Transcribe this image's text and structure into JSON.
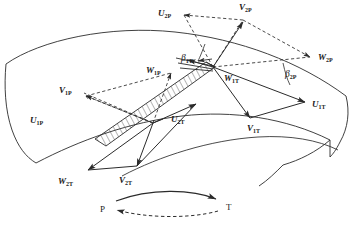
{
  "figure": {
    "type": "velocity-triangle-diagram",
    "stroke_color": "#2b2b2b",
    "label_color": "#1a1a1a",
    "background": "#ffffff"
  },
  "vectors": [
    {
      "id": "U2P",
      "symbol": "U",
      "subscript": "2P",
      "style": "dashed",
      "x": 158,
      "y": 9
    },
    {
      "id": "V2P",
      "symbol": "V",
      "subscript": "2P",
      "style": "solid",
      "x": 239,
      "y": 3
    },
    {
      "id": "W2P",
      "symbol": "W",
      "subscript": "2P",
      "style": "dashed",
      "x": 318,
      "y": 53
    },
    {
      "id": "W1P",
      "symbol": "W",
      "subscript": "1P",
      "style": "dashed",
      "x": 146,
      "y": 66
    },
    {
      "id": "V1P",
      "symbol": "V",
      "subscript": "1P",
      "style": "dashed",
      "x": 59,
      "y": 86
    },
    {
      "id": "U1P",
      "symbol": "U",
      "subscript": "1P",
      "style": "dashed",
      "x": 30,
      "y": 116
    },
    {
      "id": "W1T",
      "symbol": "W",
      "subscript": "1T",
      "style": "solid",
      "x": 224,
      "y": 74
    },
    {
      "id": "U1T",
      "symbol": "U",
      "subscript": "1T",
      "style": "solid",
      "x": 312,
      "y": 100
    },
    {
      "id": "V1T",
      "symbol": "V",
      "subscript": "1T",
      "style": "solid",
      "x": 247,
      "y": 124
    },
    {
      "id": "U2T",
      "symbol": "U",
      "subscript": "2T",
      "style": "solid",
      "x": 171,
      "y": 115
    },
    {
      "id": "V2T",
      "symbol": "V",
      "subscript": "2T",
      "style": "solid",
      "x": 119,
      "y": 176
    },
    {
      "id": "W2T",
      "symbol": "W",
      "subscript": "2T",
      "style": "solid",
      "x": 58,
      "y": 177
    }
  ],
  "angles": [
    {
      "id": "beta1T",
      "symbol": "β",
      "subscript": "1T",
      "x": 181,
      "y": 54
    },
    {
      "id": "beta2P",
      "symbol": "β",
      "subscript": "2P",
      "x": 285,
      "y": 70
    }
  ],
  "rotation_indicators": [
    {
      "id": "P",
      "label": "P",
      "x": 100,
      "y": 205
    },
    {
      "id": "T",
      "label": "T",
      "x": 226,
      "y": 203
    }
  ],
  "blade": {
    "name": "hatched-blade-section",
    "fill": "none",
    "hatch": "diagonal"
  }
}
